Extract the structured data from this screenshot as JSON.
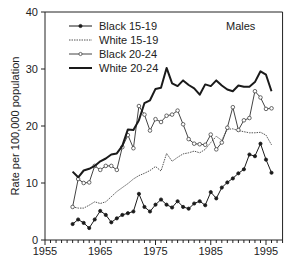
{
  "chart_data": {
    "type": "line",
    "title": "Males",
    "xlabel": "",
    "ylabel": "Rate per 100,000 population",
    "xlim": [
      1955,
      1998
    ],
    "ylim": [
      0,
      40
    ],
    "xticks": [
      1955,
      1965,
      1975,
      1985,
      1995
    ],
    "yticks": [
      0,
      10,
      20,
      30,
      40
    ],
    "grid": false,
    "legend_position": "upper left",
    "x": [
      1960,
      1961,
      1962,
      1963,
      1964,
      1965,
      1966,
      1967,
      1968,
      1969,
      1970,
      1971,
      1972,
      1973,
      1974,
      1975,
      1976,
      1977,
      1978,
      1979,
      1980,
      1981,
      1982,
      1983,
      1984,
      1985,
      1986,
      1987,
      1988,
      1989,
      1990,
      1991,
      1992,
      1993,
      1994,
      1995,
      1996
    ],
    "series": [
      {
        "name": "Black 15-19",
        "style": "solid-filled-dot",
        "values": [
          2.8,
          3.6,
          3.0,
          2.1,
          3.6,
          5.1,
          4.4,
          3.1,
          3.8,
          4.4,
          4.7,
          5.0,
          8.1,
          5.8,
          5.0,
          6.2,
          7.1,
          6.2,
          5.7,
          6.8,
          5.8,
          5.5,
          6.4,
          6.8,
          6.1,
          8.4,
          7.3,
          9.2,
          10.1,
          10.8,
          11.7,
          12.4,
          15.0,
          14.7,
          16.9,
          14.1,
          11.8
        ]
      },
      {
        "name": "White 15-19",
        "style": "dotted",
        "values": [
          5.8,
          5.6,
          5.6,
          6.1,
          6.7,
          6.4,
          6.7,
          7.6,
          8.5,
          9.2,
          9.9,
          10.7,
          11.3,
          11.7,
          12.2,
          12.9,
          12.1,
          15.2,
          13.8,
          14.5,
          15.1,
          15.3,
          15.6,
          15.3,
          15.9,
          17.1,
          18.2,
          17.5,
          19.4,
          19.5,
          19.2,
          19.0,
          18.8,
          18.8,
          18.9,
          18.4,
          16.7
        ]
      },
      {
        "name": "Black 20-24",
        "style": "solid-open-circle",
        "values": [
          5.8,
          10.7,
          10.0,
          10.1,
          13.0,
          12.3,
          13.0,
          13.0,
          12.3,
          16.3,
          18.4,
          16.1,
          23.5,
          22.0,
          19.2,
          21.2,
          20.7,
          21.8,
          22.0,
          22.7,
          20.3,
          17.7,
          16.9,
          16.8,
          16.7,
          18.5,
          15.9,
          17.1,
          19.7,
          23.3,
          19.3,
          21.0,
          21.4,
          26.1,
          25.0,
          23.0,
          23.1
        ]
      },
      {
        "name": "White 20-24",
        "style": "solid-thick",
        "values": [
          12.0,
          11.0,
          12.2,
          12.5,
          13.0,
          13.8,
          14.3,
          15.0,
          15.2,
          16.5,
          19.4,
          19.3,
          21.0,
          24.0,
          24.5,
          26.5,
          26.7,
          30.2,
          27.5,
          27.0,
          28.0,
          27.2,
          26.6,
          25.5,
          27.3,
          27.0,
          28.0,
          27.1,
          26.4,
          26.1,
          27.1,
          26.9,
          26.9,
          27.7,
          29.6,
          29.0,
          26.1
        ]
      }
    ]
  },
  "legend": {
    "items": [
      {
        "label": "Black 15-19"
      },
      {
        "label": "White  15-19"
      },
      {
        "label": "Black 20-24"
      },
      {
        "label": "White  20-24"
      }
    ]
  },
  "colors": {
    "axis": "#222222",
    "line": "#1a1a1a",
    "dotted": "#555555",
    "background": "#ffffff"
  }
}
